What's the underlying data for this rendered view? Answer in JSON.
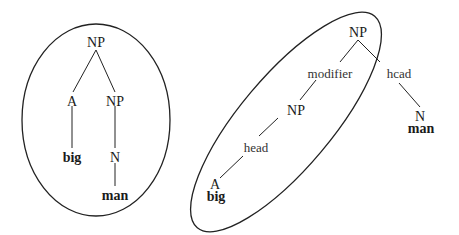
{
  "left_tree": {
    "root": "NP",
    "left_child": "A",
    "right_child": "NP",
    "left_word": "big",
    "right_preterminal": "N",
    "right_word": "man"
  },
  "right_tree": {
    "root": "NP",
    "modifier_label": "modifier",
    "head_label_right": "hcad",
    "inner_np": "NP",
    "head_label_inner": "head",
    "leaf_a": "A",
    "leaf_a_word": "big",
    "leaf_n": "N",
    "leaf_n_word": "man"
  },
  "colors": {
    "line": "#222222",
    "text": "#1a1a1a",
    "background": "#ffffff"
  }
}
